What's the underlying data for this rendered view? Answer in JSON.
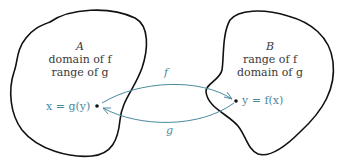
{
  "set_a": {
    "name": "A",
    "line1": "domain of f",
    "line2": "range of g"
  },
  "set_b": {
    "name": "B",
    "line1": "range of f",
    "line2": "domain of g"
  },
  "point_x": {
    "label": "x = g(y)"
  },
  "point_y": {
    "label": "y = f(x)"
  },
  "arrows": {
    "f": "f",
    "g": "g"
  },
  "colors": {
    "outline": "#111111",
    "accent": "#4a8aa0",
    "text": "#3a3a3a"
  }
}
